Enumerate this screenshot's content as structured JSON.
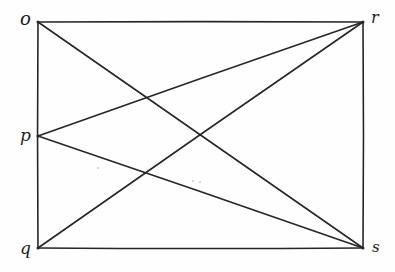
{
  "figure": {
    "kind": "hand-drawn-geometry-diagram",
    "canvas": {
      "width": 395,
      "height": 272
    },
    "ink_color": "#262626",
    "background_color": "#fefefe",
    "stroke_width": 1.6
  },
  "vertices": [
    {
      "id": "o",
      "label": "o",
      "x": 38,
      "y": 22,
      "role": "rectangle-corner",
      "corner": "top-left"
    },
    {
      "id": "r",
      "label": "r",
      "x": 363,
      "y": 22,
      "role": "rectangle-corner",
      "corner": "top-right"
    },
    {
      "id": "p",
      "label": "p",
      "x": 38,
      "y": 136,
      "role": "edge-point",
      "corner": "left-middle"
    },
    {
      "id": "q",
      "label": "q",
      "x": 38,
      "y": 248,
      "role": "rectangle-corner",
      "corner": "bottom-left"
    },
    {
      "id": "s",
      "label": "s",
      "x": 363,
      "y": 248,
      "role": "rectangle-corner",
      "corner": "bottom-right"
    }
  ],
  "edges": [
    {
      "id": "o-r",
      "from": "o",
      "to": "r",
      "type": "rectangle-side",
      "side": "top"
    },
    {
      "id": "r-s",
      "from": "r",
      "to": "s",
      "type": "rectangle-side",
      "side": "right"
    },
    {
      "id": "s-q",
      "from": "s",
      "to": "q",
      "type": "rectangle-side",
      "side": "bottom"
    },
    {
      "id": "q-o",
      "from": "q",
      "to": "o",
      "type": "rectangle-side",
      "side": "left"
    },
    {
      "id": "o-s",
      "from": "o",
      "to": "s",
      "type": "diagonal"
    },
    {
      "id": "q-r",
      "from": "q",
      "to": "r",
      "type": "diagonal"
    },
    {
      "id": "p-r",
      "from": "p",
      "to": "r",
      "type": "chord"
    },
    {
      "id": "p-s",
      "from": "p",
      "to": "s",
      "type": "chord"
    }
  ],
  "specks": [
    {
      "x": 97,
      "y": 167,
      "size": 2
    },
    {
      "x": 192,
      "y": 180,
      "size": 2
    },
    {
      "x": 199,
      "y": 181,
      "size": 2
    }
  ]
}
